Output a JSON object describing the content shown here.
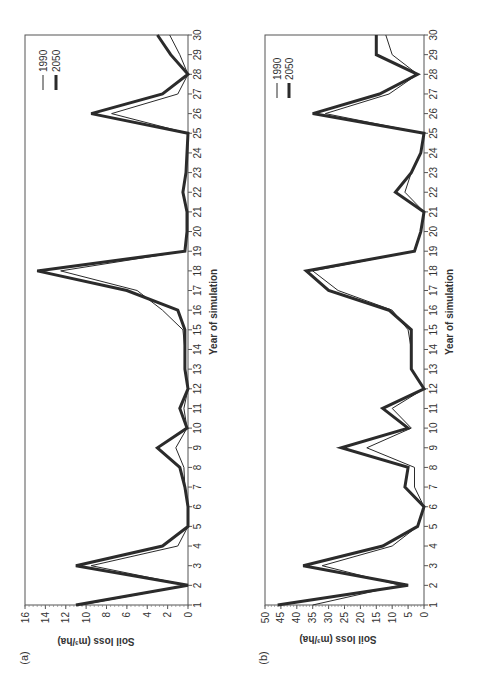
{
  "figure": {
    "orientation": "rotated 90 degrees counter-clockwise",
    "background": "#ffffff",
    "line_color": "#2b2b2b"
  },
  "chart_data": [
    {
      "panel": "(a)",
      "type": "line",
      "title": "",
      "xlabel": "Year of simulation",
      "ylabel": "Soil loss (m³/ha)",
      "x": [
        1,
        2,
        3,
        4,
        5,
        6,
        7,
        8,
        9,
        10,
        11,
        12,
        13,
        14,
        15,
        16,
        17,
        18,
        19,
        20,
        21,
        22,
        23,
        24,
        25,
        26,
        27,
        28,
        29,
        30
      ],
      "xticks": [
        "1",
        "2",
        "3",
        "4",
        "5",
        "6",
        "7",
        "8",
        "9",
        "10",
        "11",
        "12",
        "13",
        "14",
        "15",
        "16",
        "17",
        "18",
        "19",
        "20",
        "21",
        "22",
        "23",
        "24",
        "25",
        "26",
        "27",
        "28",
        "29",
        "30"
      ],
      "ylim": [
        0,
        16
      ],
      "yticks": [
        "0",
        "2",
        "4",
        "6",
        "8",
        "10",
        "12",
        "14",
        "16"
      ],
      "grid": false,
      "legend_position": "upper right (rotated)",
      "series": [
        {
          "name": "1990",
          "style": "thin",
          "values": [
            10.5,
            0,
            9.5,
            1,
            0,
            0,
            0.3,
            0.4,
            1.2,
            0.1,
            0.4,
            0,
            0.3,
            0.3,
            0.5,
            2.5,
            5,
            12.5,
            0.3,
            0.1,
            0.1,
            0.5,
            0.2,
            0.1,
            0,
            7.5,
            1,
            0,
            0.8,
            1.8
          ]
        },
        {
          "name": "2050",
          "style": "thick",
          "values": [
            11,
            0,
            11,
            2.5,
            0,
            0,
            0.3,
            0.8,
            3,
            0.1,
            0.8,
            0,
            0.3,
            0.3,
            0.3,
            1,
            6,
            14.8,
            0.3,
            0.1,
            0.1,
            0.5,
            0.2,
            0.1,
            0,
            9.5,
            2.5,
            0,
            1.7,
            3
          ]
        }
      ]
    },
    {
      "panel": "(b)",
      "type": "line",
      "title": "",
      "xlabel": "Year of simulation",
      "ylabel": "Soil loss (m³/ha)",
      "x": [
        1,
        2,
        3,
        4,
        5,
        6,
        7,
        8,
        9,
        10,
        11,
        12,
        13,
        14,
        15,
        16,
        17,
        18,
        19,
        20,
        21,
        22,
        23,
        24,
        25,
        26,
        27,
        28,
        29,
        30
      ],
      "xticks": [
        "1",
        "2",
        "3",
        "4",
        "5",
        "6",
        "7",
        "8",
        "9",
        "10",
        "11",
        "12",
        "13",
        "14",
        "15",
        "16",
        "17",
        "18",
        "19",
        "20",
        "21",
        "22",
        "23",
        "24",
        "25",
        "26",
        "27",
        "28",
        "29",
        "30"
      ],
      "ylim": [
        0,
        50
      ],
      "yticks": [
        "0",
        "5",
        "10",
        "15",
        "20",
        "25",
        "30",
        "35",
        "40",
        "45",
        "50"
      ],
      "grid": false,
      "legend_position": "upper right (rotated)",
      "series": [
        {
          "name": "1990",
          "style": "thin",
          "values": [
            35,
            7.5,
            32,
            10,
            2,
            0,
            3,
            3,
            18,
            4,
            10,
            0,
            4,
            4,
            5,
            10,
            27,
            35,
            3,
            1,
            0,
            6,
            4,
            1,
            0,
            31,
            11,
            2,
            10,
            12
          ]
        },
        {
          "name": "2050",
          "style": "thick",
          "values": [
            46,
            5,
            38,
            13,
            2,
            0,
            6,
            5,
            26,
            5,
            13,
            0,
            4,
            4,
            4,
            11,
            30,
            37,
            3,
            1,
            0,
            9,
            4,
            1,
            0,
            35,
            14,
            2,
            15,
            15
          ]
        }
      ]
    }
  ],
  "panels": [
    {
      "label": "(a)",
      "ylabel": "Soil loss (m³/ha)",
      "xlabel": "Year of simulation",
      "legend": [
        "1990",
        "2050"
      ]
    },
    {
      "label": "(b)",
      "ylabel": "Soil loss (m³/ha)",
      "xlabel": "Year of simulation",
      "legend": [
        "1990",
        "2050"
      ]
    }
  ]
}
